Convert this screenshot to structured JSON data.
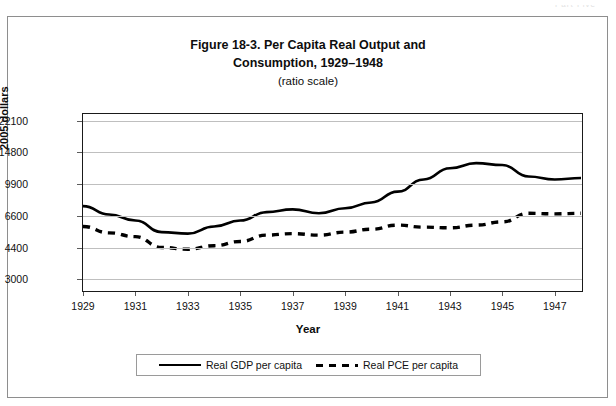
{
  "page": {
    "scan_artifact_text": "Part Five"
  },
  "figure": {
    "title_line1": "Figure 18-3. Per Capita Real Output and",
    "title_line2": "Consumption, 1929–1948",
    "subtitle": "(ratio scale)"
  },
  "axes": {
    "y_axis_title": "2005 dollars",
    "x_axis_title": "Year",
    "y_tick_labels": [
      "22100",
      "14800",
      "9900",
      "6600",
      "4400",
      "3000"
    ],
    "x_tick_labels": [
      "1929",
      "1931",
      "1933",
      "1935",
      "1937",
      "1939",
      "1941",
      "1943",
      "1945",
      "1947"
    ]
  },
  "legend": {
    "entries": [
      {
        "label": "Real GDP per capita",
        "style": "solid"
      },
      {
        "label": "Real PCE per capita",
        "style": "dashed"
      }
    ]
  },
  "chart_data": {
    "type": "line",
    "title": "Figure 18-3. Per Capita Real Output and Consumption, 1929–1948 (ratio scale)",
    "xlabel": "Year",
    "ylabel": "2005 dollars",
    "yscale": "log",
    "ylim": [
      2600,
      24000
    ],
    "xlim": [
      1929,
      1948
    ],
    "grid": true,
    "legend_position": "below-plot",
    "y_ticks": [
      3000,
      4400,
      6600,
      9900,
      14800,
      22100
    ],
    "x_ticks": [
      1929,
      1931,
      1933,
      1935,
      1937,
      1939,
      1941,
      1943,
      1945,
      1947
    ],
    "x": [
      1929,
      1930,
      1931,
      1932,
      1933,
      1934,
      1935,
      1936,
      1937,
      1938,
      1939,
      1940,
      1941,
      1942,
      1943,
      1944,
      1945,
      1946,
      1947,
      1948
    ],
    "series": [
      {
        "name": "Real GDP per capita",
        "style": "solid",
        "color": "#000000",
        "values": [
          7500,
          6750,
          6250,
          5400,
          5300,
          5800,
          6250,
          6950,
          7200,
          6850,
          7300,
          7850,
          9000,
          10500,
          12100,
          12900,
          12600,
          10900,
          10500,
          10700
        ]
      },
      {
        "name": "Real PCE per capita",
        "style": "dashed",
        "color": "#000000",
        "values": [
          5800,
          5350,
          5100,
          4450,
          4350,
          4550,
          4800,
          5200,
          5300,
          5200,
          5400,
          5600,
          5900,
          5750,
          5700,
          5900,
          6150,
          6850,
          6800,
          6850
        ]
      }
    ]
  }
}
